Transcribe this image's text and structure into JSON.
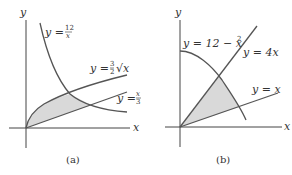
{
  "panels": [
    {
      "caption": "(a)",
      "axes": {
        "x_label": "x",
        "y_label": "y"
      },
      "curves": [
        {
          "label": "y = 12/x",
          "lhs": "y = ",
          "num": "12",
          "den": "x"
        },
        {
          "label": "y = (3/2)√x",
          "lhs": "y = ",
          "num": "3",
          "den": "2",
          "tail": "√x"
        },
        {
          "label": "y = x/3",
          "lhs": "y = ",
          "num": "x",
          "den": "3"
        }
      ],
      "shaded_region": "between y=(3/2)√x and y=x/3, below y=12/x"
    },
    {
      "caption": "(b)",
      "axes": {
        "x_label": "x",
        "y_label": "y"
      },
      "curves": [
        {
          "label": "y = 12 − x²",
          "text": "y = 12 − x",
          "sup": "2"
        },
        {
          "label": "y = 4x",
          "text": "y = 4x"
        },
        {
          "label": "y = x",
          "text": "y = x"
        }
      ],
      "shaded_region": "between y=4x and y=x, below y=12−x²"
    }
  ]
}
